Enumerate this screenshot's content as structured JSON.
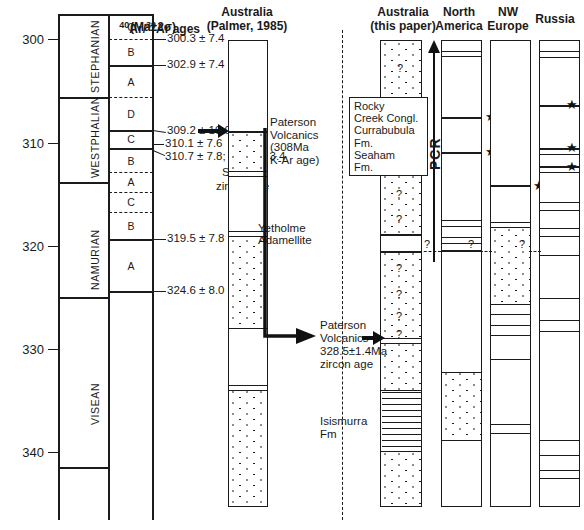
{
  "figure": {
    "headers": {
      "ar_ages_line1": "40Ar/39Ar ages",
      "ar_ages_sup1": "40",
      "ar_ages_mid": "Ar/",
      "ar_ages_sup2": "39",
      "ar_ages_end": "Ar ages",
      "ar_ages_line2": "(Ma±2σ)",
      "palmer_l1": "Australia",
      "palmer_l2": "(Palmer, 1985)",
      "thispaper_l1": "Australia",
      "thispaper_l2": "(this paper)",
      "northamerica_l1": "North",
      "northamerica_l2": "America",
      "nweurope_l1": "NW",
      "nweurope_l2": "Europe",
      "russia_l1": "Russia"
    },
    "axis": {
      "unit": "Ma",
      "ticks": [
        300,
        310,
        320,
        330,
        340
      ],
      "tick_labels": [
        "300",
        "310",
        "320",
        "330",
        "340"
      ],
      "range_top": 296.5,
      "range_bottom": 347.5
    },
    "stages": [
      {
        "name": "STEPHANIAN",
        "top": 299.0,
        "bottom": 307.0
      },
      {
        "name": "WESTPHALIAN",
        "top": 307.0,
        "bottom": 315.2
      },
      {
        "name": "NAMURIAN",
        "top": 315.2,
        "bottom": 326.3
      },
      {
        "name": "VISEAN",
        "top": 326.3,
        "bottom": 342.7
      }
    ],
    "substages": [
      {
        "label": "C",
        "top": 299.0,
        "bottom": 300.4,
        "boundary": "dashed"
      },
      {
        "label": "B",
        "top": 300.4,
        "bottom": 302.9,
        "boundary": "solid"
      },
      {
        "label": "A",
        "top": 302.9,
        "bottom": 307.0,
        "boundary": "dashed"
      },
      {
        "label": "D",
        "top": 307.0,
        "bottom": 309.3,
        "boundary": "solid-thick"
      },
      {
        "label": "C",
        "top": 309.3,
        "bottom": 310.8,
        "boundary": "solid"
      },
      {
        "label": "B",
        "top": 310.8,
        "bottom": 313.2,
        "boundary": "dashed"
      },
      {
        "label": "A",
        "top": 313.2,
        "bottom": 315.2,
        "boundary": "dashed"
      },
      {
        "label": "C",
        "top": 315.2,
        "bottom": 317.1,
        "boundary": "dashed"
      },
      {
        "label": "B",
        "top": 317.1,
        "bottom": 319.5,
        "boundary": "solid"
      },
      {
        "label": "A",
        "top": 319.5,
        "bottom": 324.6,
        "boundary": "solid"
      }
    ],
    "age_labels": [
      {
        "text": "300.3 ± 7.4",
        "age": 300.4
      },
      {
        "text": "302.9 ± 7.4",
        "age": 302.9
      },
      {
        "text": "309.2 ± 10.0",
        "age": 309.3
      },
      {
        "text": "310.1 ± 7.6",
        "age": 310.8
      },
      {
        "text": "310.7 ± 7.8; 311.0 ± 3.4",
        "age": 311.6
      },
      {
        "text": "319.5 ± 7.8",
        "age": 319.5
      },
      {
        "text": "324.6 ± 8.0",
        "age": 324.6
      }
    ],
    "shrimp_note_l1": "SHRIMP",
    "shrimp_note_l2": "zircon age",
    "annotations": {
      "paterson_palmer": "Paterson\nVolcanics\n(308Ma\nK-Ar age)",
      "paterson_this_l1": "Paterson",
      "paterson_this_l2": "Volcanics",
      "paterson_this_l3": "328.5±1.4Ma",
      "paterson_this_l4": "zircon age",
      "yetholme_l1": "Yetholme",
      "yetholme_l2": "Adamellite",
      "isismurra_l1": "Isismurra",
      "isismurra_l2": "Fm",
      "pcr_label": "PCR",
      "callout_units": "Rocky\nCreek Congl.\nCurrabubula\nFm.\nSeaham\nFm.",
      "question_marks": [
        "?",
        "?",
        "?"
      ]
    },
    "correlation_queries": [
      {
        "column": "this-paper",
        "mark": "?"
      },
      {
        "column": "north-america",
        "mark": "?"
      },
      {
        "column": "nw-europe",
        "mark": "?"
      }
    ],
    "columns": {
      "palmer": {
        "name": "Australia (Palmer, 1985)",
        "beds": [
          {
            "from": 297.5,
            "to": 309.8,
            "fill": "blank"
          },
          {
            "from": 309.8,
            "to": 314.2,
            "fill": "dots"
          },
          {
            "from": 314.2,
            "to": 315.0,
            "fill": "blank"
          },
          {
            "from": 315.0,
            "to": 321.0,
            "fill": "blank"
          },
          {
            "from": 321.0,
            "to": 331.0,
            "fill": "dots"
          },
          {
            "from": 331.0,
            "to": 337.0,
            "fill": "blank"
          },
          {
            "from": 337.0,
            "to": 347.0,
            "fill": "dots"
          }
        ]
      },
      "this_paper": {
        "name": "Australia (this paper)",
        "beds": [
          {
            "from": 297.5,
            "to": 311.5,
            "fill": "dots",
            "marks": [
              "?",
              "?"
            ]
          },
          {
            "from": 311.5,
            "to": 314.0,
            "fill": "blank"
          },
          {
            "from": 314.0,
            "to": 320.0,
            "fill": "dots",
            "marks": [
              "?",
              "?"
            ]
          },
          {
            "from": 320.0,
            "to": 322.0,
            "fill": "blank"
          },
          {
            "from": 322.0,
            "to": 330.5,
            "fill": "dots",
            "marks": [
              "?",
              "?",
              "?",
              "?"
            ]
          },
          {
            "from": 330.5,
            "to": 337.5,
            "fill": "dots"
          },
          {
            "from": 337.5,
            "to": 343.5,
            "fill": "hatch"
          },
          {
            "from": 343.5,
            "to": 347.5,
            "fill": "dots"
          }
        ]
      },
      "north_america": {
        "name": "North America",
        "beds": [
          {
            "from": 297.5,
            "to": 299.0,
            "fill": "blank"
          },
          {
            "from": 299.0,
            "to": 307.3,
            "fill": "blank"
          },
          {
            "from": 307.3,
            "to": 310.5,
            "fill": "blank",
            "star": true
          },
          {
            "from": 310.5,
            "to": 317.0,
            "fill": "blank",
            "star": true
          },
          {
            "from": 317.0,
            "to": 321.5,
            "fill": "blank"
          },
          {
            "from": 321.5,
            "to": 333.0,
            "fill": "blank"
          },
          {
            "from": 333.0,
            "to": 341.0,
            "fill": "dots"
          },
          {
            "from": 341.0,
            "to": 347.5,
            "fill": "blank"
          }
        ]
      },
      "nw_europe": {
        "name": "NW Europe",
        "beds": [
          {
            "from": 297.5,
            "to": 310.5,
            "fill": "blank"
          },
          {
            "from": 310.5,
            "to": 315.0,
            "fill": "blank",
            "star": true
          },
          {
            "from": 315.0,
            "to": 326.0,
            "fill": "dots"
          },
          {
            "from": 326.0,
            "to": 331.5,
            "fill": "blank"
          },
          {
            "from": 331.5,
            "to": 339.0,
            "fill": "blank"
          },
          {
            "from": 339.0,
            "to": 347.5,
            "fill": "blank"
          }
        ]
      },
      "russia": {
        "name": "Russia",
        "beds": [
          {
            "from": 297.5,
            "to": 299.0,
            "fill": "blank"
          },
          {
            "from": 299.0,
            "to": 307.5,
            "fill": "blank"
          },
          {
            "from": 307.5,
            "to": 311.0,
            "fill": "blank",
            "star": true
          },
          {
            "from": 311.0,
            "to": 313.0,
            "fill": "blank",
            "star": true
          },
          {
            "from": 313.0,
            "to": 318.5,
            "fill": "blank",
            "star": true
          },
          {
            "from": 318.5,
            "to": 326.0,
            "fill": "blank"
          },
          {
            "from": 326.0,
            "to": 336.5,
            "fill": "blank"
          },
          {
            "from": 336.5,
            "to": 344.0,
            "fill": "blank"
          },
          {
            "from": 344.0,
            "to": 347.5,
            "fill": "blank"
          }
        ]
      }
    },
    "colors": {
      "ink": "#1b1b1b",
      "paper": "#ffffff"
    }
  }
}
